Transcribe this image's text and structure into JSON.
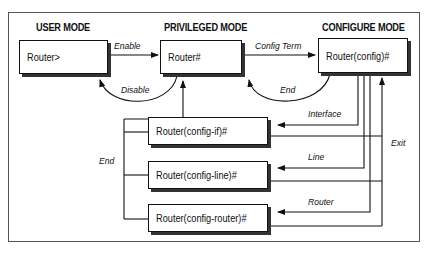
{
  "modes": {
    "user": {
      "title": "USER MODE",
      "prompt": "Router>"
    },
    "privileged": {
      "title": "PRIVILEGED MODE",
      "prompt": "Router#"
    },
    "configure": {
      "title": "CONFIGURE MODE",
      "prompt": "Router(config)#"
    }
  },
  "submodes": [
    {
      "prompt": "Router(config-if)#"
    },
    {
      "prompt": "Router(config-line)#"
    },
    {
      "prompt": "Router(config-router)#"
    }
  ],
  "transitions": {
    "enable": "Enable",
    "disable": "Disable",
    "config_term": "Config Term",
    "end_config": "End",
    "interface": "Interface",
    "line": "Line",
    "router": "Router",
    "exit": "Exit",
    "end_submodes": "End"
  },
  "colors": {
    "line": "#111111",
    "shadow": "#333333",
    "frame": "#555555"
  }
}
